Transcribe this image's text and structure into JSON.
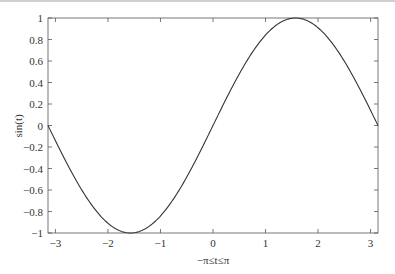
{
  "chart_data": {
    "type": "line",
    "title": "",
    "xlabel": "−π≤t≤π",
    "ylabel": "sin(t)",
    "xlim": [
      -3.14159,
      3.14159
    ],
    "ylim": [
      -1,
      1
    ],
    "grid": false,
    "legend": null,
    "xticks": [
      -3,
      -2,
      -1,
      0,
      1,
      2,
      3
    ],
    "xtick_labels": [
      "−3",
      "−2",
      "−1",
      "0",
      "1",
      "2",
      "3"
    ],
    "yticks": [
      -1,
      -0.8,
      -0.6,
      -0.4,
      -0.2,
      0,
      0.2,
      0.4,
      0.6,
      0.8,
      1
    ],
    "ytick_labels": [
      "−1",
      "−0.8",
      "−0.6",
      "−0.4",
      "−0.2",
      "0",
      "0.2",
      "0.4",
      "0.6",
      "0.8",
      "1"
    ],
    "series": [
      {
        "name": "sin(t)",
        "color": "#333333",
        "function": "sin",
        "x": [
          -3.1416,
          -2.618,
          -2.0944,
          -1.5708,
          -1.0472,
          -0.5236,
          0,
          0.5236,
          1.0472,
          1.5708,
          2.0944,
          2.618,
          3.1416
        ],
        "values": [
          0,
          -0.5,
          -0.866,
          -1,
          -0.866,
          -0.5,
          0,
          0.5,
          0.866,
          1,
          0.866,
          0.5,
          0
        ]
      }
    ]
  },
  "layout": {
    "plot_left": 48,
    "plot_right": 378,
    "plot_top": 18,
    "plot_bottom": 233
  }
}
